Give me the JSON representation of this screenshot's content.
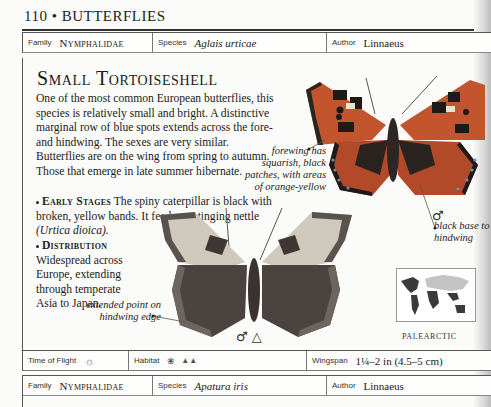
{
  "page": {
    "running_head": "110 • BUTTERFLIES"
  },
  "entry": {
    "family_label": "Family",
    "family": "Nymphalidae",
    "species_label": "Species",
    "species": "Aglais urticae",
    "author_label": "Author",
    "author": "Linnaeus",
    "title": "Small Tortoiseshell",
    "description": "One of the most common European butterflies, this species is relatively small and bright. A distinctive marginal row of blue spots extends across the fore- and hindwing. The sexes are very similar. Butterflies are on the wing from spring to autumn. Those that emerge in late summer hibernate.",
    "early_stages_heading": "Early Stages",
    "early_stages_text": "The spiny caterpillar is black with broken, yellow bands. It feeds on stinging nettle",
    "early_stages_plant": "(Urtica dioica).",
    "distribution_heading": "Distribution",
    "distribution_text": "Widespread across Europe, extending through temperate Asia to Japan.",
    "annotations": {
      "forewing": "forewing has squarish, black patches, with areas of orange-yellow",
      "black_base": "black base to hindwing",
      "extended_point": "extended point on hindwing edge"
    },
    "upperside_symbol": "♂",
    "underside_symbols": "♂ △",
    "map_label": "PALEARCTIC",
    "footer": {
      "time_of_flight_label": "Time of Flight",
      "time_of_flight_icon": "sun-icon",
      "habitat_label": "Habitat",
      "habitat_icons": [
        "grass-icon",
        "mountains-icon"
      ],
      "wingspan_label": "Wingspan",
      "wingspan": "1¼–2 in (4.5–5 cm)"
    }
  },
  "next_entry": {
    "family_label": "Family",
    "family": "Nymphalidae",
    "species_label": "Species",
    "species": "Apatura iris",
    "author_label": "Author",
    "author": "Linnaeus"
  },
  "colors": {
    "wing_orange": "#c2542e",
    "wing_black": "#1e1a18",
    "wing_yellow": "#e3c87a",
    "wing_blue": "#6d8fb8",
    "underside_dark": "#4a4340",
    "map_dark": "#3a3a3a",
    "map_light": "#c4c4c4"
  }
}
